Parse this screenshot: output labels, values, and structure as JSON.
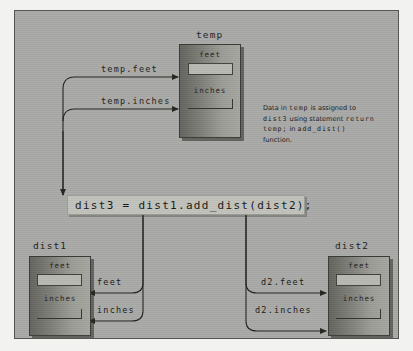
{
  "figure": {
    "background_color": "#a9a9a7",
    "panel_border_color": "#55554f"
  },
  "statement": {
    "text": "dist3 = dist1.add_dist(dist2);",
    "band_color": "#c2c2bc"
  },
  "objects": {
    "temp": {
      "label": "temp",
      "fields": {
        "feet": "feet",
        "inches": "inches"
      }
    },
    "dist1": {
      "label": "dist1",
      "fields": {
        "feet": "feet",
        "inches": "inches"
      }
    },
    "dist2": {
      "label": "dist2",
      "fields": {
        "feet": "feet",
        "inches": "inches"
      }
    }
  },
  "wire_labels": {
    "temp_feet": "temp.feet",
    "temp_inches": "temp.inches",
    "dist1_feet": "feet",
    "dist1_inches": "inches",
    "dist2_feet": "d2.feet",
    "dist2_inches": "d2.inches"
  },
  "note": {
    "line1_pre": "Data in ",
    "line1_mono": "temp",
    "line1_post": " is assigned to",
    "line2_mono": "dist3",
    "line2_post": " using statement",
    "line3_mono": "return temp;",
    "line3_post": " in",
    "line4_mono": "add_dist()",
    "line4_post": " function."
  }
}
